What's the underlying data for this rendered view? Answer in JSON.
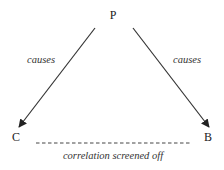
{
  "diagram": {
    "nodes": [
      {
        "id": "P",
        "label": "P"
      },
      {
        "id": "C",
        "label": "C"
      },
      {
        "id": "B",
        "label": "B"
      }
    ],
    "edges": [
      {
        "from": "P",
        "to": "C",
        "label": "causes",
        "style": "solid-arrow"
      },
      {
        "from": "P",
        "to": "B",
        "label": "causes",
        "style": "solid-arrow"
      },
      {
        "from": "C",
        "to": "B",
        "label": "correlation screened off",
        "style": "dashed-no-arrow"
      }
    ]
  },
  "colors": {
    "line": "#333333",
    "background": "#ffffff"
  }
}
